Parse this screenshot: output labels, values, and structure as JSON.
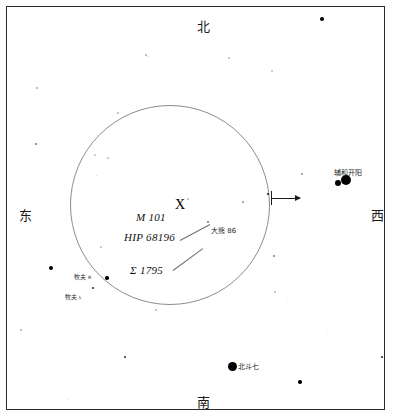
{
  "chart_data": {
    "type": "scatter",
    "title": "",
    "xlabel": "",
    "ylabel": "",
    "grid": false,
    "legend": "none",
    "xlim": [
      0,
      395
    ],
    "ylim": [
      0,
      419
    ],
    "frame": {
      "x": 6,
      "y": 6,
      "width": 379,
      "height": 404
    },
    "fov_circle": {
      "cx": 170,
      "cy": 205,
      "r": 100
    },
    "cardinals": [
      {
        "name": "north",
        "text": "北",
        "x": 197,
        "y": 20
      },
      {
        "name": "east",
        "text": "东",
        "x": 19,
        "y": 209
      },
      {
        "name": "west",
        "text": "西",
        "x": 371,
        "y": 209
      },
      {
        "name": "south",
        "text": "南",
        "x": 197,
        "y": 396
      }
    ],
    "object_labels": [
      {
        "name": "m101",
        "text": "M 101",
        "x": 136,
        "y": 212,
        "style": "italic"
      },
      {
        "name": "hip",
        "text": "HIP 68196",
        "x": 124,
        "y": 232,
        "style": "italic"
      },
      {
        "name": "sigma",
        "text": "Σ 1795",
        "x": 130,
        "y": 265,
        "style": "italic"
      }
    ],
    "target_marker": {
      "text": "X",
      "x": 175,
      "y": 198
    },
    "cjk_labels": [
      {
        "name": "ursa-major-86",
        "text": "大熊 86",
        "x": 211,
        "y": 228,
        "size": 7
      },
      {
        "name": "alcor-mizar",
        "text": "辅和开阳",
        "x": 334,
        "y": 170,
        "size": 7
      },
      {
        "name": "big-dipper",
        "text": "北斗七",
        "x": 238,
        "y": 364,
        "size": 7
      },
      {
        "name": "bootes-kappa",
        "text": "牧夫 κ",
        "x": 74,
        "y": 274,
        "size": 6
      },
      {
        "name": "bootes-iota",
        "text": "牧夫 ι",
        "x": 65,
        "y": 294,
        "size": 6
      }
    ],
    "leader_lines": [
      {
        "name": "leader-hip",
        "x1": 180,
        "y1": 240,
        "x2": 210,
        "y2": 224
      },
      {
        "name": "leader-sigma",
        "x1": 173,
        "y1": 270,
        "x2": 203,
        "y2": 248
      }
    ],
    "fov_arrow": {
      "x1": 271,
      "y1": 198,
      "x2": 300,
      "y2": 198,
      "direction": "west"
    },
    "stars": [
      {
        "x": 322,
        "y": 19,
        "r": 2.0,
        "o": 1.0
      },
      {
        "x": 146,
        "y": 55,
        "r": 0.7,
        "o": 0.3
      },
      {
        "x": 229,
        "y": 58,
        "r": 0.6,
        "o": 0.22
      },
      {
        "x": 147,
        "y": 56,
        "r": 0.5,
        "o": 0.25
      },
      {
        "x": 37,
        "y": 88,
        "r": 0.7,
        "o": 0.3
      },
      {
        "x": 272,
        "y": 71,
        "r": 0.6,
        "o": 0.2
      },
      {
        "x": 36,
        "y": 144,
        "r": 1.0,
        "o": 0.55
      },
      {
        "x": 118,
        "y": 113,
        "r": 0.6,
        "o": 0.25
      },
      {
        "x": 205,
        "y": 90,
        "r": 0.5,
        "o": 0.18
      },
      {
        "x": 302,
        "y": 174,
        "r": 1.0,
        "o": 0.45
      },
      {
        "x": 346,
        "y": 180,
        "r": 5.0,
        "o": 1.0
      },
      {
        "x": 338,
        "y": 183,
        "r": 3.0,
        "o": 1.0
      },
      {
        "x": 268,
        "y": 194,
        "r": 1.3,
        "o": 0.95
      },
      {
        "x": 243,
        "y": 202,
        "r": 0.8,
        "o": 0.4
      },
      {
        "x": 188,
        "y": 199,
        "r": 0.6,
        "o": 0.25
      },
      {
        "x": 208,
        "y": 222,
        "r": 0.8,
        "o": 0.5
      },
      {
        "x": 95,
        "y": 155,
        "r": 0.6,
        "o": 0.2
      },
      {
        "x": 108,
        "y": 158,
        "r": 0.6,
        "o": 0.22
      },
      {
        "x": 96,
        "y": 175,
        "r": 0.5,
        "o": 0.18
      },
      {
        "x": 168,
        "y": 238,
        "r": 0.5,
        "o": 0.18
      },
      {
        "x": 224,
        "y": 238,
        "r": 0.5,
        "o": 0.18
      },
      {
        "x": 51,
        "y": 268,
        "r": 2.2,
        "o": 1.0
      },
      {
        "x": 107,
        "y": 278,
        "r": 1.8,
        "o": 1.0
      },
      {
        "x": 93,
        "y": 288,
        "r": 1.2,
        "o": 0.85
      },
      {
        "x": 101,
        "y": 247,
        "r": 0.6,
        "o": 0.22
      },
      {
        "x": 156,
        "y": 310,
        "r": 0.6,
        "o": 0.25
      },
      {
        "x": 274,
        "y": 256,
        "r": 0.8,
        "o": 0.45
      },
      {
        "x": 330,
        "y": 245,
        "r": 0.5,
        "o": 0.18
      },
      {
        "x": 275,
        "y": 292,
        "r": 0.6,
        "o": 0.22
      },
      {
        "x": 289,
        "y": 290,
        "r": 0.5,
        "o": 0.15
      },
      {
        "x": 327,
        "y": 330,
        "r": 0.5,
        "o": 0.15
      },
      {
        "x": 21,
        "y": 330,
        "r": 0.7,
        "o": 0.3
      },
      {
        "x": 125,
        "y": 357,
        "r": 1.1,
        "o": 0.85
      },
      {
        "x": 232,
        "y": 366,
        "r": 4.5,
        "o": 1.0
      },
      {
        "x": 300,
        "y": 382,
        "r": 1.8,
        "o": 1.0
      },
      {
        "x": 382,
        "y": 357,
        "r": 1.2,
        "o": 0.9
      },
      {
        "x": 68,
        "y": 399,
        "r": 0.5,
        "o": 0.18
      },
      {
        "x": 122,
        "y": 400,
        "r": 0.5,
        "o": 0.15
      },
      {
        "x": 287,
        "y": 301,
        "r": 0.5,
        "o": 0.15
      },
      {
        "x": 246,
        "y": 173,
        "r": 0.5,
        "o": 0.15
      }
    ]
  },
  "colors": {
    "frame": "#2b2b2b",
    "circle": "#8d8d8d",
    "star": "#000000",
    "text": "#1a1a1a",
    "background": "#ffffff"
  }
}
